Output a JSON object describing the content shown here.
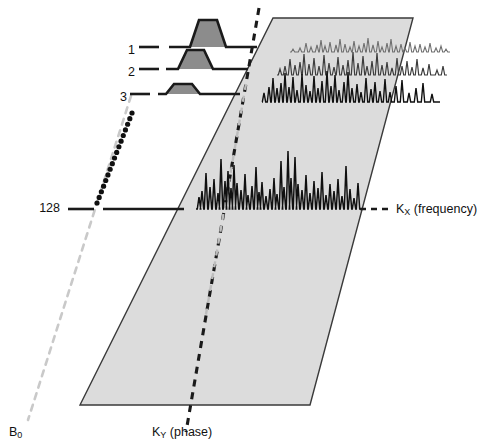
{
  "figure": {
    "colors": {
      "plane_fill": "#dcdcdc",
      "plane_stroke": "#3a3a3a",
      "pulse_fill": "#8c8c8c",
      "pulse_stroke": "#1a1a1a",
      "trace_dark": "#101010",
      "trace_mid": "#3c3c3c",
      "trace_light": "#6e6e6e",
      "b0_dash": "#c9c9c9",
      "ky_dash": "#1a1a1a",
      "ellipsis_dots": "#101010",
      "baseline": "#1a1a1a"
    },
    "plane": {
      "top_left": [
        273,
        18
      ],
      "top_right": [
        413,
        18
      ],
      "bottom_right": [
        310,
        405
      ],
      "bottom_left": [
        80,
        405
      ]
    }
  },
  "phase_encode_rows": [
    {
      "id": "row-1",
      "label": "1",
      "label_x": 128,
      "label_y": 51,
      "baseline_y": 47,
      "lead_dash": [
        139,
        159
      ],
      "baseline": [
        169,
        257
      ],
      "pulse": {
        "x0": 190,
        "x1": 226,
        "ramp": 9,
        "height": 27
      }
    },
    {
      "id": "row-2",
      "label": "2",
      "label_x": 128,
      "label_y": 73,
      "baseline_y": 69,
      "lead_dash": [
        139,
        159
      ],
      "baseline": [
        166,
        248
      ],
      "pulse": {
        "x0": 178,
        "x1": 213,
        "ramp": 9,
        "height": 19
      }
    },
    {
      "id": "row-3",
      "label": "3",
      "label_x": 120,
      "label_y": 98,
      "baseline_y": 94,
      "lead_dash": [
        130,
        150
      ],
      "baseline": [
        158,
        240
      ],
      "pulse": {
        "x0": 166,
        "x1": 200,
        "ramp": 8,
        "height": 10
      }
    },
    {
      "id": "row-128",
      "label": "128",
      "label_x": 58,
      "label_y": 213,
      "baseline_y": 209,
      "lead_dash": [
        68,
        94
      ],
      "baseline": [
        103,
        184
      ],
      "pulse": null
    }
  ],
  "ellipsis": {
    "name": "rows-continuation-dots",
    "from": [
      97,
      203
    ],
    "to": [
      132,
      113
    ],
    "dot_count": 17,
    "dot_radius": 2.6
  },
  "axes": [
    {
      "id": "kx-axis",
      "name": "kx-frequency-axis",
      "text": "K",
      "subscript": "X",
      "suffix": " (frequency)",
      "label_x": 396,
      "label_y": 211,
      "dash_from": [
        360,
        209
      ],
      "dash_to": [
        393,
        209
      ]
    },
    {
      "id": "ky-axis",
      "name": "ky-phase-axis",
      "text": "K",
      "subscript": "Y",
      "suffix": " (phase)",
      "label_x": 152,
      "label_y": 437,
      "dash_from": [
        259,
        8
      ],
      "dash_to": [
        186,
        432
      ]
    },
    {
      "id": "b0-axis",
      "name": "b0-axis",
      "text": "B",
      "subscript": "0",
      "suffix": "",
      "label_x": 10,
      "label_y": 437,
      "dash_from": [
        131,
        96
      ],
      "dash_to": [
        28,
        420
      ]
    }
  ],
  "spectra": [
    {
      "id": "spectrum-top",
      "name": "spectrum-trace-row1",
      "stroke": "#6e6e6e",
      "stroke_width": 1.1,
      "origin_x": 290,
      "baseline_y": 52,
      "width": 160,
      "scale": 1.0,
      "peaks": [
        [
          3,
          3
        ],
        [
          10,
          4
        ],
        [
          16,
          9
        ],
        [
          21,
          5
        ],
        [
          27,
          7
        ],
        [
          31,
          12
        ],
        [
          35,
          6
        ],
        [
          40,
          10
        ],
        [
          46,
          7
        ],
        [
          50,
          13
        ],
        [
          55,
          8
        ],
        [
          60,
          5
        ],
        [
          64,
          11
        ],
        [
          69,
          6
        ],
        [
          74,
          9
        ],
        [
          78,
          14
        ],
        [
          83,
          7
        ],
        [
          88,
          11
        ],
        [
          92,
          5
        ],
        [
          97,
          9
        ],
        [
          101,
          13
        ],
        [
          106,
          6
        ],
        [
          111,
          8
        ],
        [
          115,
          4
        ],
        [
          120,
          10
        ],
        [
          125,
          6
        ],
        [
          130,
          8
        ],
        [
          135,
          5
        ],
        [
          140,
          9
        ],
        [
          146,
          4
        ],
        [
          151,
          6
        ],
        [
          156,
          3
        ]
      ]
    },
    {
      "id": "spectrum-mid",
      "name": "spectrum-trace-row2",
      "stroke": "#3c3c3c",
      "stroke_width": 1.2,
      "origin_x": 277,
      "baseline_y": 75,
      "width": 170,
      "scale": 1.0,
      "peaks": [
        [
          3,
          6
        ],
        [
          8,
          9
        ],
        [
          13,
          16
        ],
        [
          18,
          10
        ],
        [
          23,
          13
        ],
        [
          27,
          21
        ],
        [
          32,
          11
        ],
        [
          37,
          17
        ],
        [
          42,
          9
        ],
        [
          47,
          20
        ],
        [
          52,
          12
        ],
        [
          57,
          8
        ],
        [
          61,
          18
        ],
        [
          66,
          10
        ],
        [
          71,
          15
        ],
        [
          76,
          23
        ],
        [
          81,
          12
        ],
        [
          86,
          19
        ],
        [
          90,
          9
        ],
        [
          95,
          14
        ],
        [
          100,
          22
        ],
        [
          105,
          10
        ],
        [
          110,
          13
        ],
        [
          115,
          7
        ],
        [
          120,
          17
        ],
        [
          125,
          9
        ],
        [
          130,
          14
        ],
        [
          135,
          8
        ],
        [
          140,
          16
        ],
        [
          146,
          7
        ],
        [
          152,
          11
        ],
        [
          160,
          5
        ],
        [
          166,
          9
        ]
      ]
    },
    {
      "id": "spectrum-low",
      "name": "spectrum-trace-row3",
      "stroke": "#101010",
      "stroke_width": 1.4,
      "origin_x": 262,
      "baseline_y": 102,
      "width": 178,
      "scale": 1.0,
      "peaks": [
        [
          2,
          9
        ],
        [
          7,
          15
        ],
        [
          11,
          24
        ],
        [
          15,
          14
        ],
        [
          19,
          19
        ],
        [
          23,
          29
        ],
        [
          27,
          15
        ],
        [
          31,
          25
        ],
        [
          35,
          12
        ],
        [
          40,
          28
        ],
        [
          44,
          17
        ],
        [
          48,
          11
        ],
        [
          52,
          26
        ],
        [
          56,
          14
        ],
        [
          60,
          21
        ],
        [
          65,
          31
        ],
        [
          69,
          16
        ],
        [
          73,
          27
        ],
        [
          77,
          12
        ],
        [
          82,
          20
        ],
        [
          86,
          30
        ],
        [
          90,
          14
        ],
        [
          95,
          18
        ],
        [
          99,
          10
        ],
        [
          104,
          24
        ],
        [
          109,
          13
        ],
        [
          113,
          20
        ],
        [
          118,
          11
        ],
        [
          123,
          23
        ],
        [
          128,
          10
        ],
        [
          134,
          16
        ],
        [
          140,
          22
        ],
        [
          147,
          9
        ],
        [
          154,
          14
        ],
        [
          161,
          19
        ],
        [
          170,
          8
        ]
      ]
    },
    {
      "id": "spectrum-main",
      "name": "spectrum-trace-main",
      "stroke": "#101010",
      "stroke_width": 1.5,
      "origin_x": 196,
      "baseline_y": 209,
      "width": 168,
      "scale": 1.0,
      "peaks": [
        [
          3,
          12
        ],
        [
          6,
          18
        ],
        [
          10,
          36
        ],
        [
          14,
          22
        ],
        [
          18,
          30
        ],
        [
          22,
          16
        ],
        [
          25,
          50
        ],
        [
          29,
          28
        ],
        [
          32,
          38
        ],
        [
          35,
          21
        ],
        [
          38,
          44
        ],
        [
          41,
          26
        ],
        [
          45,
          19
        ],
        [
          49,
          35
        ],
        [
          52,
          14
        ],
        [
          56,
          23
        ],
        [
          60,
          42
        ],
        [
          63,
          17
        ],
        [
          66,
          27
        ],
        [
          70,
          13
        ],
        [
          74,
          20
        ],
        [
          78,
          31
        ],
        [
          81,
          15
        ],
        [
          85,
          48
        ],
        [
          88,
          22
        ],
        [
          92,
          58
        ],
        [
          95,
          31
        ],
        [
          99,
          52
        ],
        [
          102,
          25
        ],
        [
          106,
          19
        ],
        [
          110,
          34
        ],
        [
          114,
          16
        ],
        [
          118,
          28
        ],
        [
          122,
          21
        ],
        [
          126,
          37
        ],
        [
          130,
          14
        ],
        [
          134,
          25
        ],
        [
          138,
          18
        ],
        [
          142,
          30
        ],
        [
          146,
          13
        ],
        [
          150,
          43
        ],
        [
          154,
          20
        ],
        [
          158,
          11
        ],
        [
          162,
          26
        ]
      ]
    }
  ]
}
